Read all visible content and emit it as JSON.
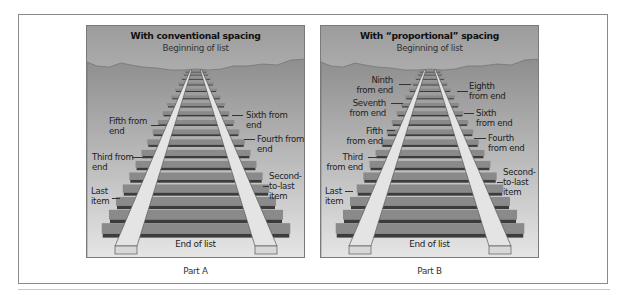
{
  "figure": {
    "part_a": {
      "title": "With conventional spacing",
      "top_label": "Beginning of list",
      "bottom_label": "End of list",
      "caption": "Part A",
      "labels_left": [
        {
          "text": "Fifth from\nend",
          "line1": "Fifth from",
          "line2": "end"
        },
        {
          "text": "Third from\nend",
          "line1": "Third from",
          "line2": "end"
        },
        {
          "text": "Last\nitem",
          "line1": "Last",
          "line2": "item"
        }
      ],
      "labels_right": [
        {
          "text": "Sixth from\nend",
          "line1": "Sixth from",
          "line2": "end"
        },
        {
          "text": "Fourth from\nend",
          "line1": "Fourth from",
          "line2": "end"
        },
        {
          "text": "Second-\nto-last\nitem",
          "line1": "Second-",
          "line2": "to-last",
          "line3": "item"
        }
      ]
    },
    "part_b": {
      "title": "With “proportional” spacing",
      "top_label": "Beginning of list",
      "bottom_label": "End of list",
      "caption": "Part B",
      "labels_left": [
        {
          "line1": "Ninth",
          "line2": "from end"
        },
        {
          "line1": "Seventh",
          "line2": "from end"
        },
        {
          "line1": "Fifth",
          "line2": "from end"
        },
        {
          "line1": "Third",
          "line2": "from end"
        },
        {
          "line1": "Last",
          "line2": "item"
        }
      ],
      "labels_right": [
        {
          "line1": "Eighth",
          "line2": "from end"
        },
        {
          "line1": "Sixth",
          "line2": "from end"
        },
        {
          "line1": "Fourth",
          "line2": "from end"
        },
        {
          "line1": "Second-",
          "line2": "to-last",
          "line3": "item"
        }
      ]
    }
  },
  "colors": {
    "sky_top": "#9c9c9c",
    "sky_bottom": "#f2f2f2",
    "ground_top": "#8e8e8e",
    "ground_bottom": "#e6e6e6",
    "tie_face": "#8a8a8a",
    "tie_shadow": "#3c3c3c",
    "rail_face": "#e4e4e4",
    "rail_edge": "#5a5a5a"
  }
}
